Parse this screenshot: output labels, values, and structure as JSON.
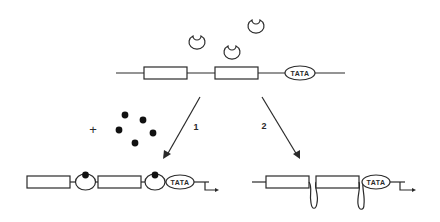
{
  "diagram": {
    "top_gene": {
      "promoter_label": "TATA",
      "exon_count": 2
    },
    "free_proteins": {
      "count": 3,
      "icon": "horseshoe-protein-icon"
    },
    "ligand": {
      "symbol": "+",
      "dot_count": 5
    },
    "pathways": [
      {
        "label": "1",
        "description": "ligand-bound protein binds between exons"
      },
      {
        "label": "2",
        "description": "DNA loops out between exons"
      }
    ],
    "bottom_left_gene": {
      "promoter_label": "TATA"
    },
    "bottom_right_gene": {
      "promoter_label": "TATA"
    }
  }
}
